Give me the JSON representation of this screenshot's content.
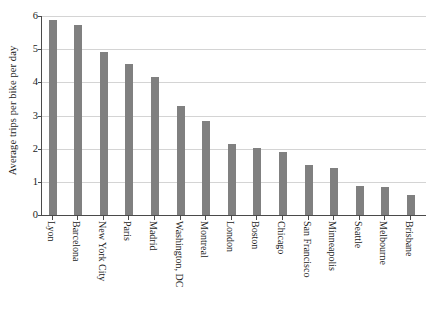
{
  "chart_data": {
    "type": "bar",
    "title": "",
    "xlabel": "",
    "ylabel": "Average trips per bike per day",
    "ylim": [
      0,
      6
    ],
    "yticks": [
      "0",
      "1",
      "2",
      "3",
      "4",
      "5",
      "6"
    ],
    "grid": true,
    "legend": "none",
    "orientation": "vertical",
    "bar_color": "#808080",
    "axis_color": "#4a4a4a",
    "gridline_color": "#d4d4d4",
    "categories": [
      "Lyon",
      "Barcelona",
      "New York City",
      "Paris",
      "Madrid",
      "Washington, DC",
      "Montreal",
      "London",
      "Boston",
      "Chicago",
      "San Francisco",
      "Minneapolis",
      "Seattle",
      "Melbourne",
      "Brisbane"
    ],
    "values": [
      5.87,
      5.72,
      4.9,
      4.55,
      4.17,
      3.28,
      2.82,
      2.15,
      2.02,
      1.9,
      1.5,
      1.42,
      0.87,
      0.85,
      0.6
    ]
  }
}
